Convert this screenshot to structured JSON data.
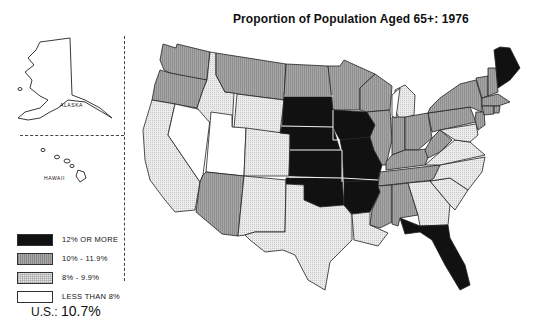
{
  "title": "Proportion of Population Aged 65+: 1976",
  "insets": {
    "alaska_label": "ALASKA",
    "hawaii_label": "HAWAII"
  },
  "legend": {
    "items": [
      {
        "label": "12% OR MORE",
        "class": "black",
        "color": "#111111"
      },
      {
        "label": "10% - 11.9%",
        "class": "dark",
        "color": "#a8a8a8"
      },
      {
        "label": "8% - 9.9%",
        "class": "light",
        "color": "#e6e6e6"
      },
      {
        "label": "LESS THAN 8%",
        "class": "white",
        "color": "#ffffff"
      }
    ]
  },
  "us_total": {
    "prefix": "U.S.: ",
    "value": "10.7%"
  },
  "states": {
    "12_or_more": [
      "ME",
      "SD",
      "NE",
      "IA",
      "KS",
      "MO",
      "OK",
      "AR",
      "FL"
    ],
    "10_to_11.9": [
      "WA",
      "OR",
      "MT",
      "ND",
      "MN",
      "WI",
      "IL",
      "IN",
      "OH",
      "KY",
      "TN",
      "MS",
      "AL",
      "WV",
      "PA",
      "NY",
      "VT",
      "NH",
      "MA",
      "RI",
      "CT",
      "NJ",
      "AZ",
      "WY"
    ],
    "8_to_9.9": [
      "CA",
      "ID",
      "CO",
      "NM",
      "TX",
      "LA",
      "GA",
      "SC",
      "NC",
      "VA",
      "MD",
      "DE",
      "MI"
    ],
    "less_than_8": [
      "NV",
      "UT",
      "AK",
      "HI"
    ]
  }
}
